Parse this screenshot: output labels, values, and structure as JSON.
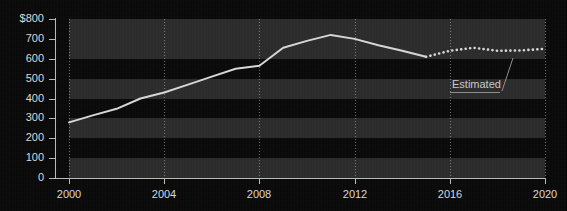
{
  "chart_data": {
    "type": "line",
    "title": "",
    "xlabel": "",
    "ylabel": "",
    "xlim": [
      2000,
      2020
    ],
    "ylim": [
      0,
      800
    ],
    "grid": "vertical dotted gridlines at x ticks; alternating horizontal bands every 100 units",
    "legend_position": "none",
    "y_ticks": [
      0,
      100,
      200,
      300,
      400,
      500,
      600,
      700,
      800
    ],
    "y_tick_labels": [
      "0",
      "100",
      "200",
      "300",
      "400",
      "500",
      "600",
      "700",
      "$800"
    ],
    "x_ticks": [
      2000,
      2004,
      2008,
      2012,
      2016,
      2020
    ],
    "x_tick_labels": [
      "2000",
      "2004",
      "2008",
      "2012",
      "2016",
      "2020"
    ],
    "x": [
      2000,
      2001,
      2002,
      2003,
      2004,
      2005,
      2006,
      2007,
      2008,
      2009,
      2010,
      2011,
      2012,
      2013,
      2014,
      2015,
      2016,
      2017,
      2018,
      2019,
      2020
    ],
    "series": [
      {
        "name": "Actual",
        "style": "solid",
        "color": "#d6d6d6",
        "x": [
          2000,
          2001,
          2002,
          2003,
          2004,
          2005,
          2006,
          2007,
          2008,
          2009,
          2010,
          2011,
          2012,
          2013,
          2014,
          2015
        ],
        "values": [
          280,
          315,
          348,
          400,
          430,
          470,
          510,
          550,
          565,
          655,
          690,
          720,
          700,
          668,
          640,
          610
        ]
      },
      {
        "name": "Estimated",
        "style": "dotted",
        "color": "#d6d6d6",
        "x": [
          2015,
          2016,
          2017,
          2018,
          2019,
          2020
        ],
        "values": [
          610,
          640,
          655,
          640,
          642,
          650
        ]
      }
    ],
    "annotations": [
      {
        "text": "Estimated",
        "points_to_year": 2019,
        "points_to_value": 645
      }
    ]
  },
  "axes": {
    "y_labels": [
      "$800",
      "700",
      "600",
      "500",
      "400",
      "300",
      "200",
      "100",
      "0"
    ],
    "x_labels": [
      "2000",
      "2004",
      "2008",
      "2012",
      "2016",
      "2020"
    ]
  },
  "annotation": {
    "estimated_label": "Estimated"
  },
  "colors": {
    "background": "#090909",
    "band": "#2b2b2b",
    "line": "#d6d6d6",
    "axis": "#b9b9b9",
    "text": "#d9d9d9"
  }
}
